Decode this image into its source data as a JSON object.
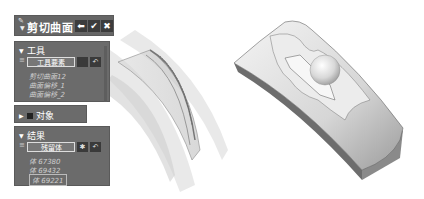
{
  "dialog": {
    "title": "剪切曲面",
    "buttons": {
      "back": "⬅",
      "ok": "✔",
      "cancel": "✖"
    }
  },
  "tools_section": {
    "header": "工具",
    "field_label": "工具要素",
    "items": [
      "剪切曲面12",
      "曲面偏移_1",
      "曲面偏移_2"
    ]
  },
  "objects_section": {
    "header": "对象"
  },
  "result_section": {
    "header": "结果",
    "field_label": "残留体",
    "items": [
      "体 67380",
      "体 69432",
      "体 69221"
    ]
  },
  "viewport": {
    "left_model": "transparent curved surfaces being trimmed",
    "right_model": "trimmed curved solid with sphere"
  }
}
